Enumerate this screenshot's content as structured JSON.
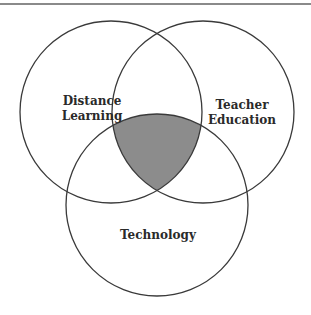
{
  "diagram": {
    "type": "venn",
    "sets": [
      {
        "id": "distance-learning",
        "label_lines": [
          "Distance",
          "Learning"
        ],
        "circle": {
          "cx": 111,
          "cy": 112,
          "r": 91
        }
      },
      {
        "id": "teacher-education",
        "label_lines": [
          "Teacher",
          "Education"
        ],
        "circle": {
          "cx": 203,
          "cy": 112,
          "r": 91
        }
      },
      {
        "id": "technology",
        "label_lines": [
          "Technology"
        ],
        "circle": {
          "cx": 157,
          "cy": 205,
          "r": 91
        }
      }
    ],
    "highlighted_region": {
      "description": "intersection of all three sets",
      "sets": [
        "distance-learning",
        "teacher-education",
        "technology"
      ]
    },
    "colors": {
      "stroke": "#3a3a3a",
      "fill_highlight": "#8c8c8c",
      "background": "#ffffff",
      "rule": "#8a8a8a"
    }
  }
}
